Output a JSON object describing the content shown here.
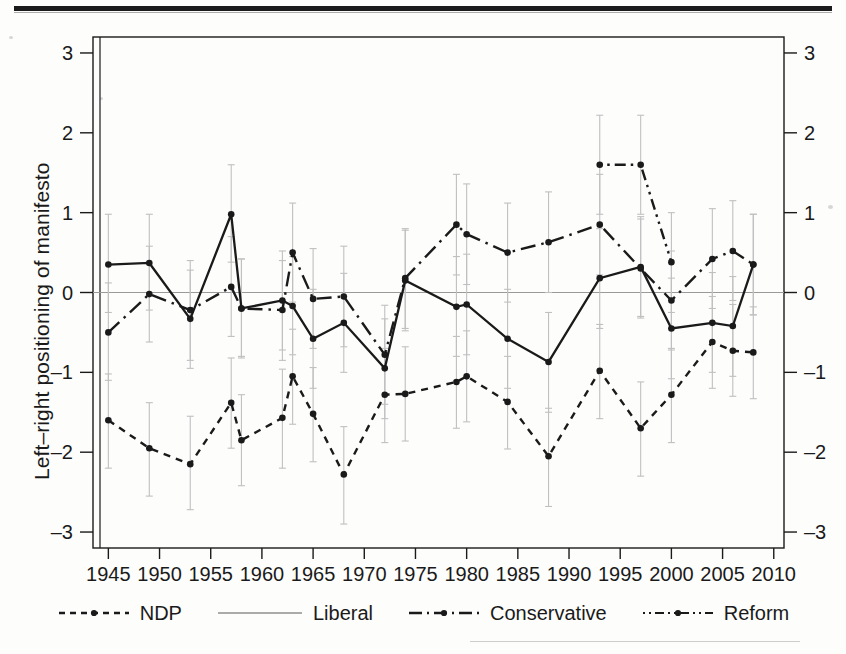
{
  "figure": {
    "has_top_rule": true,
    "background": "#fdfdfc"
  },
  "axes": {
    "y_label": "Left–right positioning of manifesto",
    "y_ticks": [
      "3",
      "2",
      "1",
      "0",
      "-1",
      "-2",
      "-3"
    ],
    "y_ticks_right": [
      "3",
      "2",
      "1",
      "0",
      "-1",
      "-2",
      "-3"
    ],
    "x_ticks": [
      "1945",
      "1950",
      "1955",
      "1960",
      "1965",
      "1970",
      "1975",
      "1980",
      "1985",
      "1990",
      "1995",
      "2000",
      "2005",
      "2010"
    ]
  },
  "legend": {
    "items": [
      {
        "label": "NDP",
        "style": "dashed",
        "color": "#1a1a1a"
      },
      {
        "label": "Liberal",
        "style": "solid",
        "color": "#1a1a1a"
      },
      {
        "label": "Conservative",
        "style": "dash-dot",
        "color": "#1a1a1a"
      },
      {
        "label": "Reform",
        "style": "dot-dash-fine",
        "color": "#1a1a1a"
      }
    ]
  },
  "chart_data": {
    "type": "line",
    "title": "",
    "xlabel": "",
    "ylabel": "Left–right positioning of manifesto",
    "xlim": [
      1943.5,
      2011
    ],
    "ylim": [
      -3.2,
      3.2
    ],
    "grid": false,
    "zero_line": true,
    "legend_position": "bottom",
    "error_bars": "vertical 95% confidence intervals (light grey)",
    "series": [
      {
        "name": "NDP",
        "style": "dashed",
        "points": [
          {
            "x": 1945,
            "y": -1.6,
            "lo": -2.2,
            "hi": -1.02
          },
          {
            "x": 1949,
            "y": -1.95,
            "lo": -2.55,
            "hi": -1.38
          },
          {
            "x": 1953,
            "y": -2.15,
            "lo": -2.72,
            "hi": -1.55
          },
          {
            "x": 1957,
            "y": -1.38,
            "lo": -1.95,
            "hi": -0.82
          },
          {
            "x": 1958,
            "y": -1.85,
            "lo": -2.42,
            "hi": -1.28
          },
          {
            "x": 1962,
            "y": -1.57,
            "lo": -2.2,
            "hi": -0.96
          },
          {
            "x": 1963,
            "y": -1.05,
            "lo": -1.65,
            "hi": -0.46
          },
          {
            "x": 1965,
            "y": -1.52,
            "lo": -2.12,
            "hi": -0.94
          },
          {
            "x": 1968,
            "y": -2.28,
            "lo": -2.9,
            "hi": -1.68
          },
          {
            "x": 1972,
            "y": -1.28,
            "lo": -1.88,
            "hi": -0.7
          },
          {
            "x": 1974,
            "y": -1.27,
            "lo": -1.86,
            "hi": -0.68
          },
          {
            "x": 1979,
            "y": -1.12,
            "lo": -1.7,
            "hi": -0.55
          },
          {
            "x": 1980,
            "y": -1.05,
            "lo": -1.62,
            "hi": -0.48
          },
          {
            "x": 1984,
            "y": -1.37,
            "lo": -1.96,
            "hi": -0.8
          },
          {
            "x": 1988,
            "y": -2.05,
            "lo": -2.68,
            "hi": -1.45
          },
          {
            "x": 1993,
            "y": -0.98,
            "lo": -1.58,
            "hi": -0.4
          },
          {
            "x": 1997,
            "y": -1.7,
            "lo": -2.3,
            "hi": -1.12
          },
          {
            "x": 2000,
            "y": -1.28,
            "lo": -1.88,
            "hi": -0.7
          },
          {
            "x": 2004,
            "y": -0.62,
            "lo": -1.2,
            "hi": -0.05
          },
          {
            "x": 2006,
            "y": -0.73,
            "lo": -1.3,
            "hi": -0.15
          },
          {
            "x": 2008,
            "y": -0.75,
            "lo": -1.33,
            "hi": -0.18
          }
        ]
      },
      {
        "name": "Liberal",
        "style": "solid",
        "points": [
          {
            "x": 1945,
            "y": 0.35,
            "lo": -0.25,
            "hi": 0.98
          },
          {
            "x": 1949,
            "y": 0.37,
            "lo": -0.22,
            "hi": 0.98
          },
          {
            "x": 1953,
            "y": -0.33,
            "lo": -0.95,
            "hi": 0.28
          },
          {
            "x": 1957,
            "y": 0.98,
            "lo": 0.38,
            "hi": 1.6
          },
          {
            "x": 1958,
            "y": -0.2,
            "lo": -0.8,
            "hi": 0.42
          },
          {
            "x": 1962,
            "y": -0.1,
            "lo": -0.72,
            "hi": 0.52
          },
          {
            "x": 1963,
            "y": -0.17,
            "lo": -0.78,
            "hi": 0.45
          },
          {
            "x": 1965,
            "y": -0.58,
            "lo": -1.2,
            "hi": 0.04
          },
          {
            "x": 1968,
            "y": -0.38,
            "lo": -1.0,
            "hi": 0.24
          },
          {
            "x": 1972,
            "y": -0.95,
            "lo": -1.58,
            "hi": -0.33
          },
          {
            "x": 1974,
            "y": 0.15,
            "lo": -0.48,
            "hi": 0.78
          },
          {
            "x": 1979,
            "y": -0.18,
            "lo": -0.8,
            "hi": 0.45
          },
          {
            "x": 1980,
            "y": -0.15,
            "lo": -0.78,
            "hi": 0.48
          },
          {
            "x": 1984,
            "y": -0.58,
            "lo": -1.2,
            "hi": 0.04
          },
          {
            "x": 1988,
            "y": -0.87,
            "lo": -1.5,
            "hi": -0.25
          },
          {
            "x": 1993,
            "y": 0.18,
            "lo": -0.45,
            "hi": 0.8
          },
          {
            "x": 1997,
            "y": 0.32,
            "lo": -0.3,
            "hi": 0.95
          },
          {
            "x": 2000,
            "y": -0.45,
            "lo": -1.08,
            "hi": 0.18
          },
          {
            "x": 2004,
            "y": -0.38,
            "lo": -1.0,
            "hi": 0.25
          },
          {
            "x": 2006,
            "y": -0.42,
            "lo": -1.05,
            "hi": 0.2
          },
          {
            "x": 2008,
            "y": 0.35,
            "lo": -0.28,
            "hi": 0.98
          }
        ]
      },
      {
        "name": "Conservative",
        "style": "dash-dot",
        "points": [
          {
            "x": 1945,
            "y": -0.5,
            "lo": -1.1,
            "hi": 0.12
          },
          {
            "x": 1949,
            "y": -0.02,
            "lo": -0.62,
            "hi": 0.58
          },
          {
            "x": 1953,
            "y": -0.22,
            "lo": -0.85,
            "hi": 0.4
          },
          {
            "x": 1957,
            "y": 0.07,
            "lo": -0.55,
            "hi": 0.7
          },
          {
            "x": 1958,
            "y": -0.2,
            "lo": -0.82,
            "hi": 0.42
          },
          {
            "x": 1962,
            "y": -0.22,
            "lo": -0.85,
            "hi": 0.4
          },
          {
            "x": 1963,
            "y": 0.5,
            "lo": -0.12,
            "hi": 1.12
          },
          {
            "x": 1965,
            "y": -0.08,
            "lo": -0.7,
            "hi": 0.55
          },
          {
            "x": 1968,
            "y": -0.05,
            "lo": -0.68,
            "hi": 0.58
          },
          {
            "x": 1972,
            "y": -0.78,
            "lo": -1.4,
            "hi": -0.16
          },
          {
            "x": 1974,
            "y": 0.18,
            "lo": -0.45,
            "hi": 0.8
          },
          {
            "x": 1979,
            "y": 0.85,
            "lo": 0.22,
            "hi": 1.48
          },
          {
            "x": 1980,
            "y": 0.73,
            "lo": 0.1,
            "hi": 1.36
          },
          {
            "x": 1984,
            "y": 0.5,
            "lo": -0.12,
            "hi": 1.12
          },
          {
            "x": 1988,
            "y": 0.63,
            "lo": 0.0,
            "hi": 1.26
          },
          {
            "x": 1993,
            "y": 0.85,
            "lo": 0.22,
            "hi": 1.48
          },
          {
            "x": 1997,
            "y": 0.3,
            "lo": -0.32,
            "hi": 0.92
          },
          {
            "x": 2000,
            "y": -0.1,
            "lo": -0.72,
            "hi": 0.52
          },
          {
            "x": 2004,
            "y": 0.42,
            "lo": -0.2,
            "hi": 1.05
          },
          {
            "x": 2006,
            "y": 0.52,
            "lo": -0.1,
            "hi": 1.15
          },
          {
            "x": 2008,
            "y": 0.35,
            "lo": -0.28,
            "hi": 0.98
          }
        ]
      },
      {
        "name": "Reform",
        "style": "dot-dash-fine",
        "points": [
          {
            "x": 1993,
            "y": 1.6,
            "lo": 0.98,
            "hi": 2.22
          },
          {
            "x": 1997,
            "y": 1.6,
            "lo": 0.98,
            "hi": 2.22
          },
          {
            "x": 2000,
            "y": 0.38,
            "lo": -0.25,
            "hi": 1.0
          }
        ]
      }
    ]
  }
}
